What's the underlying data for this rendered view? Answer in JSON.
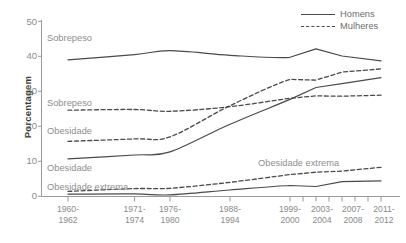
{
  "chart_data": {
    "type": "line",
    "title": "",
    "xlabel": "",
    "ylabel": "Porcentagem",
    "ylim": [
      0,
      50
    ],
    "yticks": [
      0,
      10,
      20,
      30,
      40,
      50
    ],
    "grid": false,
    "legend_position": "top-right",
    "categories": [
      "1960-1962",
      "1971-1974",
      "1976-1980",
      "1988-1994",
      "1999-2000",
      "2003-2004",
      "2007-2008",
      "2011-2012"
    ],
    "series": [
      {
        "name": "Sobrepeso - Homens",
        "style": "solid",
        "values": [
          39.0,
          40.5,
          41.6,
          40.3,
          39.7,
          42.1,
          40.1,
          38.7
        ]
      },
      {
        "name": "Sobrepeso - Mulheres",
        "style": "dashed",
        "values": [
          24.6,
          24.8,
          24.3,
          25.6,
          28.0,
          28.7,
          28.6,
          28.9
        ]
      },
      {
        "name": "Obesidade - Homens",
        "style": "solid",
        "values": [
          10.7,
          11.8,
          12.7,
          20.6,
          27.7,
          31.1,
          32.2,
          33.9
        ]
      },
      {
        "name": "Obesidade - Mulheres",
        "style": "dashed",
        "values": [
          15.7,
          16.4,
          17.0,
          25.9,
          33.4,
          33.2,
          35.5,
          36.4
        ]
      },
      {
        "name": "Obesidade extrema - Homens",
        "style": "solid",
        "values": [
          0.6,
          0.7,
          0.4,
          1.8,
          3.1,
          2.8,
          4.2,
          4.4
        ]
      },
      {
        "name": "Obesidade extrema - Mulheres",
        "style": "dashed",
        "values": [
          1.4,
          2.2,
          2.3,
          4.0,
          6.2,
          6.9,
          7.2,
          8.3
        ]
      }
    ],
    "legend": [
      {
        "label": "Homens",
        "style": "solid"
      },
      {
        "label": "Mulheres",
        "style": "dashed"
      }
    ],
    "annotations": [
      {
        "text": "Sobrepeso",
        "series": "Sobrepeso - Homens"
      },
      {
        "text": "Sobrepeso",
        "series": "Sobrepeso - Mulheres"
      },
      {
        "text": "Obesidade",
        "series": "Obesidade - Mulheres"
      },
      {
        "text": "Obesidade",
        "series": "Obesidade - Homens"
      },
      {
        "text": "Obesidade extrema",
        "series": "Obesidade extrema - Mulheres"
      },
      {
        "text": "Obesidade extrema",
        "series": "Obesidade extrema - Homens"
      }
    ]
  },
  "colors": {
    "line": "#4a4a4a",
    "axis": "#9a9a9a",
    "tick_text": "#8a8a8a",
    "annotation_text": "#8e8e8e",
    "axis_title": "#3b3b3b",
    "background": "#ffffff"
  }
}
